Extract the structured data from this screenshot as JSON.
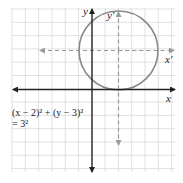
{
  "diagram": {
    "type": "coordinate-plane-translated-circle",
    "grid": {
      "x_min": -6,
      "x_max": 6,
      "y_min": -6,
      "y_max": 6,
      "spacing_px": 13.3
    },
    "axes": {
      "x_label": "x",
      "y_label": "y"
    },
    "translated_axes": {
      "x_label": "x'",
      "y_label": "y'",
      "origin": [
        2,
        3
      ]
    },
    "circle": {
      "center": [
        2,
        3
      ],
      "radius": 3,
      "color": "#8a8a8a"
    },
    "equation": {
      "line1": "(x − 2)² + (y − 3)²",
      "line2": "= 3²"
    },
    "colors": {
      "axis": "#222222",
      "grid": "#d9d9d9",
      "circle": "#8a8a8a",
      "dashed": "#9a9a9a"
    }
  }
}
